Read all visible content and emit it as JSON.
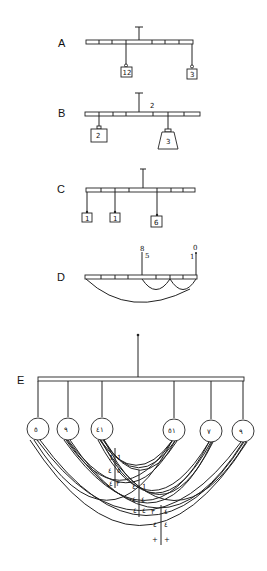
{
  "page": {
    "top_cut_text": "···· ·····"
  },
  "figures": {
    "A": {
      "label": "A",
      "weights": [
        "12",
        "3"
      ]
    },
    "B": {
      "label": "B",
      "beam_mark": "2",
      "weights": [
        "2",
        "3"
      ]
    },
    "C": {
      "label": "C",
      "weights": [
        "1",
        "1",
        "6"
      ]
    },
    "D": {
      "label": "D",
      "marks": [
        "8",
        "5",
        "1",
        "0"
      ]
    },
    "E": {
      "label": "E",
      "pans": [
        "٥",
        "٩",
        "٤١",
        "٥١",
        "٧",
        "٩"
      ],
      "table": [
        [
          "1",
          "1"
        ],
        [
          "٤",
          "٥"
        ],
        [
          "٤",
          "٣"
        ],
        [
          "٤",
          "1"
        ],
        [
          "٤",
          "٤"
        ],
        [
          "٤",
          "٤"
        ],
        [
          "٣",
          "٤"
        ],
        [
          "٤",
          "٤"
        ],
        [
          "٤",
          "٥"
        ],
        [
          "+",
          "+"
        ]
      ]
    }
  }
}
